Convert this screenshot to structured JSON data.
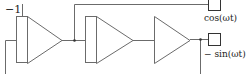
{
  "diagram": {
    "type": "block-diagram",
    "labels": {
      "gain_input": "−1",
      "output_top": "cos(ωt)",
      "output_bottom": "− sin(ωt)"
    },
    "blocks": [
      {
        "id": "integrator-1",
        "kind": "integrator"
      },
      {
        "id": "integrator-2",
        "kind": "integrator"
      },
      {
        "id": "amplifier",
        "kind": "gain"
      }
    ],
    "outputs": [
      {
        "id": "scope-cos",
        "label": "cos(ωt)"
      },
      {
        "id": "scope-neg-sin",
        "label": "− sin(ωt)"
      }
    ],
    "colors": {
      "stroke": "#6b6b6b",
      "text": "#222222"
    }
  }
}
